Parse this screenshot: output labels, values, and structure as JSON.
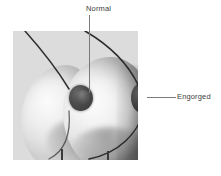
{
  "figure": {
    "type": "medical-illustration",
    "panel": {
      "background_color": "#dcdcdc",
      "left_px": 13,
      "top_px": 31,
      "width_px": 125,
      "height_px": 129
    },
    "labels": [
      {
        "id": "normal",
        "text": "Normal",
        "leader": "vertical",
        "points_to": "normal-nipple",
        "color": "#3c3c3c"
      },
      {
        "id": "engorged",
        "text": "Engorged",
        "leader": "horizontal",
        "points_to": "engorged-nipple",
        "color": "#3c3c3c"
      }
    ],
    "structures": [
      {
        "id": "breast-left",
        "name": "normal breast profile"
      },
      {
        "id": "breast-right",
        "name": "engorged breast profile"
      },
      {
        "id": "nipple-normal",
        "name": "normal nipple and areola"
      },
      {
        "id": "nipple-engorged",
        "name": "engorged protruding nipple"
      }
    ]
  }
}
